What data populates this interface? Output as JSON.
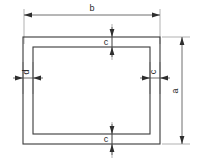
{
  "drawing": {
    "type": "engineering-dimension-drawing",
    "description": "Rectangular hollow section cross-section with dimension callouts",
    "canvas": {
      "width": 198,
      "height": 163,
      "background": "#ffffff"
    },
    "colors": {
      "outline": "#3a3a3a",
      "dimension_line": "#4a4a4a",
      "extension_line": "#8f8f8f",
      "arrow": "#2e2e2e",
      "text": "#2b2b2b"
    },
    "shapes": {
      "outer_rect": {
        "x": 23,
        "y": 37,
        "width": 137,
        "height": 107
      },
      "inner_rect": {
        "x": 33,
        "y": 47,
        "width": 117,
        "height": 87
      }
    },
    "dimensions": [
      {
        "id": "b",
        "label": "b",
        "orientation": "horizontal",
        "position": "top",
        "label_x": 92,
        "label_y": 12,
        "line_y": 15,
        "from_x": 24,
        "to_x": 160,
        "measures": "overall-width"
      },
      {
        "id": "a",
        "label": "a",
        "orientation": "vertical",
        "position": "right",
        "label_x": 179,
        "label_y": 91,
        "line_x": 182,
        "from_y": 37,
        "to_y": 144,
        "measures": "overall-height"
      },
      {
        "id": "d",
        "label": "d",
        "orientation": "horizontal",
        "position": "left-wall",
        "label_x": 30,
        "label_y": 72,
        "line_y": 78,
        "from_x": 23,
        "to_x": 33,
        "measures": "left-wall-thickness"
      },
      {
        "id": "c-right",
        "label": "c",
        "orientation": "horizontal",
        "position": "right-wall",
        "label_x": 157,
        "label_y": 72,
        "line_y": 78,
        "from_x": 150,
        "to_x": 160,
        "measures": "right-wall-thickness"
      },
      {
        "id": "c-top",
        "label": "c",
        "orientation": "vertical",
        "position": "top-wall",
        "label_x": 107,
        "label_y": 45,
        "line_x": 112,
        "from_y": 37,
        "to_y": 47,
        "measures": "top-wall-thickness"
      },
      {
        "id": "c-bottom",
        "label": "c",
        "orientation": "vertical",
        "position": "bottom-wall",
        "label_x": 107,
        "label_y": 142,
        "line_x": 112,
        "from_y": 134,
        "to_y": 144,
        "measures": "bottom-wall-thickness"
      }
    ],
    "labels": {
      "b": "b",
      "a": "a",
      "d": "d",
      "c_right": "c",
      "c_top": "c",
      "c_bottom": "c"
    }
  }
}
